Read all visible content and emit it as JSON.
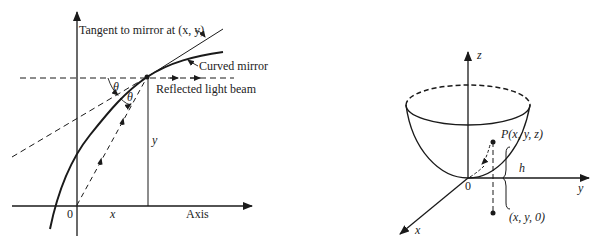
{
  "left_diagram": {
    "labels": {
      "tangent": "Tangent to mirror at (x, y)",
      "curved_mirror": "Curved mirror",
      "reflected_beam": "Reflected light beam",
      "theta1": "θ",
      "theta2": "θ",
      "y_label": "y",
      "x_label": "x",
      "origin": "0",
      "axis": "Axis"
    }
  },
  "right_diagram": {
    "labels": {
      "z_axis": "z",
      "y_axis": "y",
      "x_axis": "x",
      "origin": "0",
      "point_p": "P(x, y, z)",
      "height": "h",
      "projection": "(x, y, 0)"
    }
  },
  "colors": {
    "ink": "#1a1a1a",
    "background": "#ffffff"
  }
}
